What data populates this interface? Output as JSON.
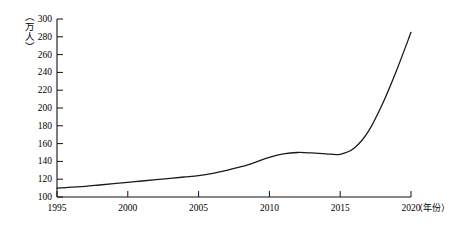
{
  "chart_data": {
    "type": "line",
    "title": "",
    "xlabel": "（年份）",
    "ylabel": "（万人）",
    "xlim": [
      1995,
      2020
    ],
    "ylim": [
      100,
      300
    ],
    "grid": false,
    "legend": null,
    "x_ticks": [
      "1995",
      "2000",
      "2005",
      "2010",
      "2015",
      "2020"
    ],
    "x_tick_values": [
      1995,
      2000,
      2005,
      2010,
      2015,
      2020
    ],
    "y_ticks": [
      "100",
      "120",
      "140",
      "160",
      "180",
      "200",
      "220",
      "240",
      "260",
      "280",
      "300"
    ],
    "y_tick_values": [
      100,
      120,
      140,
      160,
      180,
      200,
      220,
      240,
      260,
      280,
      300
    ],
    "series": [
      {
        "name": "人口",
        "color": "#1a1a1a",
        "x": [
          1995,
          1996,
          1997,
          1998,
          1999,
          2000,
          2001,
          2002,
          2003,
          2004,
          2005,
          2006,
          2007,
          2008,
          2009,
          2010,
          2011,
          2012,
          2013,
          2014,
          2015,
          2016,
          2017,
          2018,
          2019,
          2020
        ],
        "values": [
          110,
          111,
          112,
          113.5,
          115,
          116.5,
          118,
          119.5,
          121,
          122.5,
          124,
          126.5,
          130,
          134,
          139,
          144.5,
          148.5,
          150,
          149.5,
          148.5,
          148,
          155,
          174,
          205,
          243,
          285
        ]
      }
    ]
  },
  "axis": {
    "y_unit": "（万人）",
    "x_unit": "（年份）"
  }
}
